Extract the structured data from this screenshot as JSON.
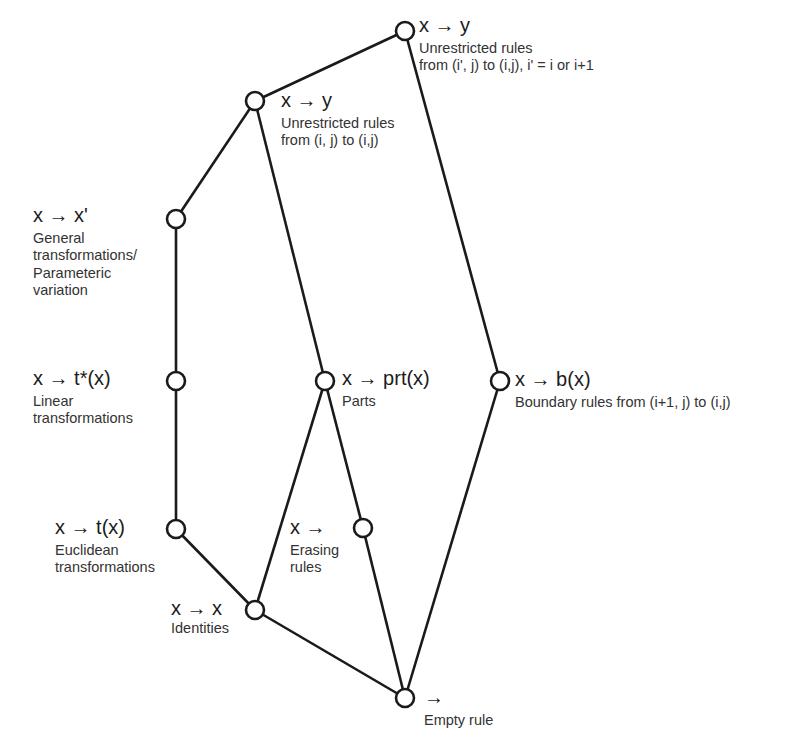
{
  "diagram": {
    "nodes": [
      {
        "id": "unrestricted-shift",
        "rule": "x → y",
        "desc": [
          "Unrestricted rules",
          "from (i', j) to (i,j), i' = i or i+1"
        ]
      },
      {
        "id": "unrestricted",
        "rule": "x → y",
        "desc": [
          "Unrestricted rules",
          "from (i, j) to (i,j)"
        ]
      },
      {
        "id": "general",
        "rule": "x → x'",
        "desc": [
          "General",
          "transformations/",
          "Parameteric",
          "variation"
        ]
      },
      {
        "id": "linear",
        "rule": "x → t*(x)",
        "desc": [
          "Linear",
          "transformations"
        ]
      },
      {
        "id": "euclidean",
        "rule": "x → t(x)",
        "desc": [
          "Euclidean",
          "transformations"
        ]
      },
      {
        "id": "identities",
        "rule": "x → x",
        "desc": [
          "Identities"
        ]
      },
      {
        "id": "parts",
        "rule": "x → prt(x)",
        "desc": [
          "Parts"
        ]
      },
      {
        "id": "erasing",
        "rule": "x →",
        "desc": [
          "Erasing",
          "rules"
        ]
      },
      {
        "id": "boundary",
        "rule": "x → b(x)",
        "desc": [
          "Boundary rules from (i+1, j) to (i,j)"
        ]
      },
      {
        "id": "empty",
        "rule": "→",
        "desc": [
          "Empty rule"
        ]
      }
    ],
    "edges": [
      [
        "unrestricted",
        "unrestricted-shift"
      ],
      [
        "general",
        "unrestricted"
      ],
      [
        "linear",
        "general"
      ],
      [
        "euclidean",
        "linear"
      ],
      [
        "identities",
        "euclidean"
      ],
      [
        "parts",
        "unrestricted"
      ],
      [
        "identities",
        "parts"
      ],
      [
        "erasing",
        "parts"
      ],
      [
        "empty",
        "erasing"
      ],
      [
        "empty",
        "identities"
      ],
      [
        "boundary",
        "unrestricted-shift"
      ],
      [
        "empty",
        "boundary"
      ]
    ],
    "colors": {
      "line": "#1a1a1a",
      "node_fill": "#ffffff",
      "text": "#2a2a2a"
    }
  }
}
